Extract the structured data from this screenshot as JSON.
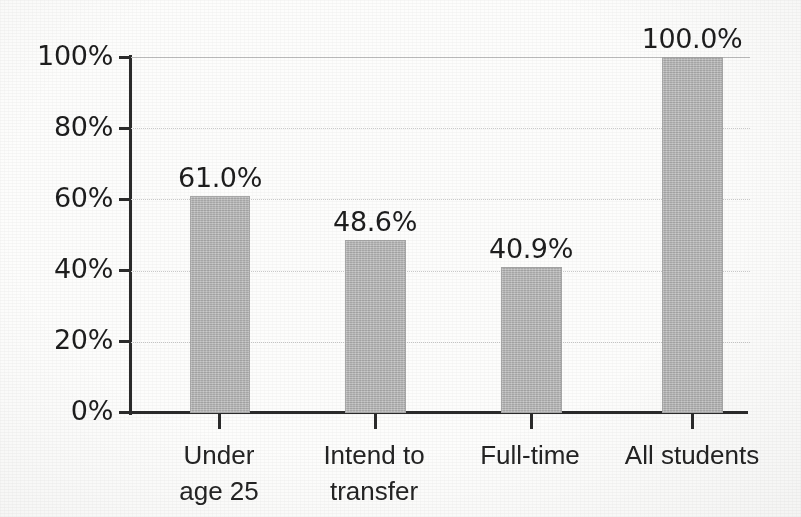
{
  "chart_data": {
    "type": "bar",
    "title": "",
    "subtitle": "",
    "xlabel": "",
    "ylabel": "",
    "categories": [
      "Under\nage 25",
      "Intend to\ntransfer",
      "Full-time",
      "All students"
    ],
    "values": [
      61.0,
      48.6,
      40.9,
      100.0
    ],
    "value_labels": [
      "61.0%",
      "48.6%",
      "40.9%",
      "100.0%"
    ],
    "ylim": [
      0,
      100
    ],
    "ytick_values": [
      0,
      20,
      40,
      60,
      80,
      100
    ],
    "ytick_labels": [
      "0%",
      "20%",
      "40%",
      "60%",
      "80%",
      "100%"
    ],
    "grid": true,
    "grid_axis": "y",
    "legend": null,
    "legend_position": "none",
    "series": [
      {
        "name": "Percent of students",
        "values": [
          61.0,
          48.6,
          40.9,
          100.0
        ]
      }
    ],
    "colors": {
      "bar_fill": "#b6b6b6",
      "bar_stroke": "#a7a7a7",
      "axis": "#2b2b2b",
      "gridline": "#c9c9c9",
      "text": "#1d1d1d",
      "background": "#fdfdfc"
    }
  }
}
